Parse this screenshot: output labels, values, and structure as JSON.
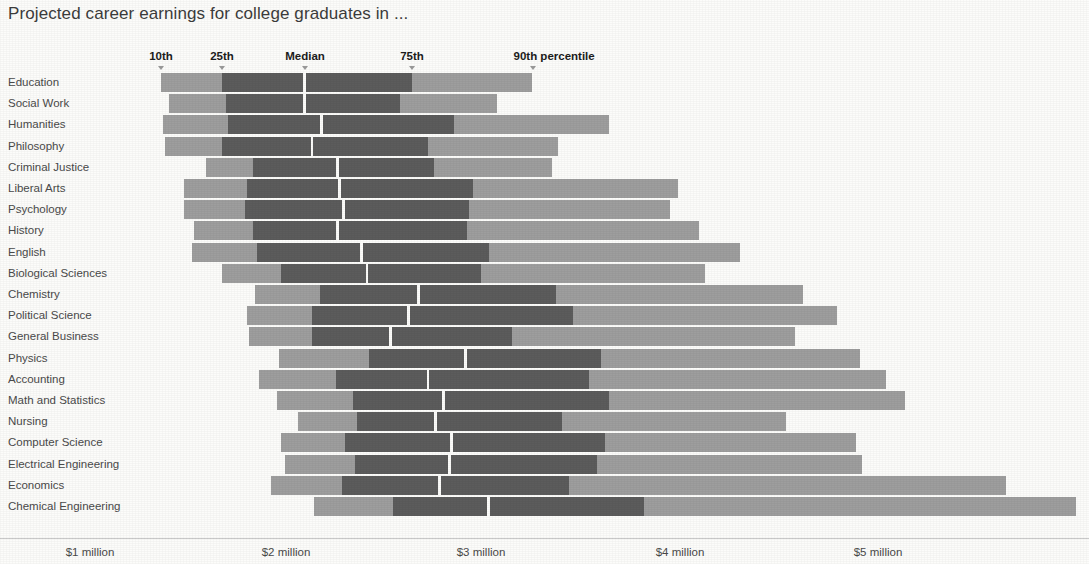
{
  "header": {
    "title": "Projected career earnings for college graduates in ..."
  },
  "colors": {
    "light_band": "#9e9e9e",
    "dark_band": "#5c5c5c",
    "background": "#fcfcfa",
    "text": "#4a4a4a",
    "header_text": "#1c1c1c"
  },
  "percentile_headers": [
    {
      "label": "10th",
      "x_px": 161
    },
    {
      "label": "25th",
      "x_px": 222
    },
    {
      "label": "Median",
      "x_px": 305
    },
    {
      "label": "75th",
      "x_px": 412
    },
    {
      "label": "90th percentile",
      "x_px": 533
    }
  ],
  "axis": {
    "tick_labels": [
      "$1 million",
      "$2 million",
      "$3 million",
      "$4 million",
      "$5 million"
    ],
    "tick_values": [
      1,
      2,
      3,
      4,
      5
    ],
    "tick_x_px": [
      90,
      286,
      481,
      680,
      878
    ],
    "px_per_million": 196.5,
    "x_at_zero_px": -106.5
  },
  "chart_data": {
    "type": "bar",
    "subtype": "percentile-range-bars",
    "title": "Projected career earnings for college graduates in ...",
    "xlabel": "",
    "ylabel": "",
    "xlim": [
      0.9,
      6.0
    ],
    "x_tick_labels": [
      "$1 million",
      "$2 million",
      "$3 million",
      "$4 million",
      "$5 million"
    ],
    "grid": false,
    "legend": [
      "10th",
      "25th",
      "Median",
      "75th",
      "90th percentile"
    ],
    "units": "millions of dollars (projected lifetime career earnings)",
    "series_keys": [
      "p10",
      "p25",
      "median",
      "p75",
      "p90"
    ],
    "categories": [
      "Education",
      "Social Work",
      "Humanities",
      "Philosophy",
      "Criminal Justice",
      "Liberal Arts",
      "Psychology",
      "History",
      "English",
      "Biological Sciences",
      "Chemistry",
      "Political Science",
      "General Business",
      "Physics",
      "Accounting",
      "Math and Statistics",
      "Nursing",
      "Computer Science",
      "Electrical Engineering",
      "Economics",
      "Chemical Engineering"
    ],
    "rows": [
      {
        "major": "Education",
        "p10": 1.36,
        "p25": 1.67,
        "median": 2.09,
        "p75": 2.64,
        "p90": 3.25
      },
      {
        "major": "Social Work",
        "p10": 1.4,
        "p25": 1.69,
        "median": 2.09,
        "p75": 2.58,
        "p90": 3.07
      },
      {
        "major": "Humanities",
        "p10": 1.37,
        "p25": 1.7,
        "median": 2.18,
        "p75": 2.85,
        "p90": 3.64
      },
      {
        "major": "Philosophy",
        "p10": 1.38,
        "p25": 1.67,
        "median": 2.13,
        "p75": 2.72,
        "p90": 3.38
      },
      {
        "major": "Criminal Justice",
        "p10": 1.59,
        "p25": 1.83,
        "median": 2.26,
        "p75": 2.75,
        "p90": 3.35
      },
      {
        "major": "Liberal Arts",
        "p10": 1.48,
        "p25": 1.8,
        "median": 2.27,
        "p75": 2.95,
        "p90": 3.99
      },
      {
        "major": "Psychology",
        "p10": 1.48,
        "p25": 1.79,
        "median": 2.29,
        "p75": 2.93,
        "p90": 3.95
      },
      {
        "major": "History",
        "p10": 1.53,
        "p25": 1.83,
        "median": 2.26,
        "p75": 2.92,
        "p90": 4.1
      },
      {
        "major": "English",
        "p10": 1.52,
        "p25": 1.85,
        "median": 2.38,
        "p75": 3.03,
        "p90": 4.31
      },
      {
        "major": "Biological Sciences",
        "p10": 1.67,
        "p25": 1.97,
        "median": 2.41,
        "p75": 2.99,
        "p90": 4.13
      },
      {
        "major": "Chemistry",
        "p10": 1.84,
        "p25": 2.17,
        "median": 2.67,
        "p75": 3.37,
        "p90": 4.63
      },
      {
        "major": "Political Science",
        "p10": 1.8,
        "p25": 2.13,
        "median": 2.62,
        "p75": 3.46,
        "p90": 4.8
      },
      {
        "major": "General Business",
        "p10": 1.81,
        "p25": 2.13,
        "median": 2.53,
        "p75": 3.15,
        "p90": 4.59
      },
      {
        "major": "Physics",
        "p10": 1.96,
        "p25": 2.42,
        "median": 2.91,
        "p75": 3.6,
        "p90": 4.92
      },
      {
        "major": "Accounting",
        "p10": 1.86,
        "p25": 2.25,
        "median": 2.72,
        "p75": 3.54,
        "p90": 5.05
      },
      {
        "major": "Math and Statistics",
        "p10": 1.95,
        "p25": 2.34,
        "median": 2.8,
        "p75": 3.64,
        "p90": 5.15
      },
      {
        "major": "Nursing",
        "p10": 2.06,
        "p25": 2.36,
        "median": 2.76,
        "p75": 3.4,
        "p90": 4.54
      },
      {
        "major": "Computer Science",
        "p10": 1.97,
        "p25": 2.3,
        "median": 2.84,
        "p75": 3.62,
        "p90": 4.9
      },
      {
        "major": "Electrical Engineering",
        "p10": 1.99,
        "p25": 2.35,
        "median": 2.83,
        "p75": 3.58,
        "p90": 4.93
      },
      {
        "major": "Economics",
        "p10": 1.92,
        "p25": 2.28,
        "median": 2.78,
        "p75": 3.44,
        "p90": 5.66
      },
      {
        "major": "Chemical Engineering",
        "p10": 2.14,
        "p25": 2.54,
        "median": 3.03,
        "p75": 3.82,
        "p90": 6.02
      }
    ]
  },
  "layout": {
    "row_top_start_px": 73,
    "row_pitch_px": 21.2,
    "bar_height_px": 19,
    "label_col_width_px": 150,
    "baseline_y_px": 538
  }
}
